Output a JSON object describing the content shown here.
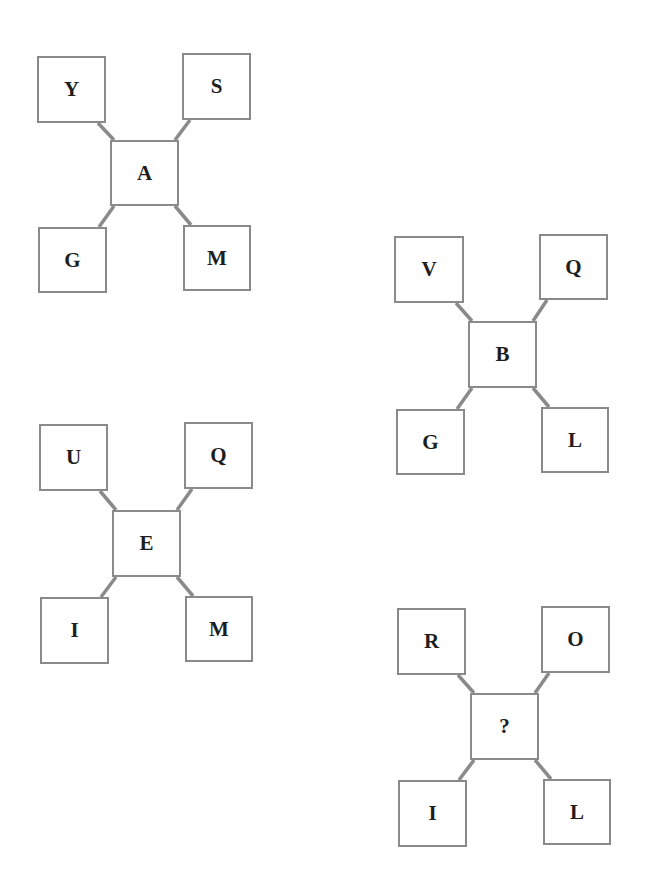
{
  "puzzle": {
    "colors": {
      "border": "#8a8a8a",
      "connector": "#8a8a8a",
      "text": "#1e1e1e",
      "background": "#ffffff"
    },
    "clusters": [
      {
        "id": "cluster-1",
        "center": {
          "label": "A",
          "x": 110,
          "y": 140,
          "w": 69,
          "h": 66
        },
        "top_left": {
          "label": "Y",
          "x": 37,
          "y": 56,
          "w": 69,
          "h": 67
        },
        "top_right": {
          "label": "S",
          "x": 182,
          "y": 53,
          "w": 69,
          "h": 67
        },
        "bottom_left": {
          "label": "G",
          "x": 38,
          "y": 227,
          "w": 69,
          "h": 66
        },
        "bottom_right": {
          "label": "M",
          "x": 183,
          "y": 225,
          "w": 68,
          "h": 66
        }
      },
      {
        "id": "cluster-2",
        "center": {
          "label": "B",
          "x": 468,
          "y": 321,
          "w": 69,
          "h": 67
        },
        "top_left": {
          "label": "V",
          "x": 394,
          "y": 236,
          "w": 70,
          "h": 67
        },
        "top_right": {
          "label": "Q",
          "x": 539,
          "y": 234,
          "w": 69,
          "h": 66
        },
        "bottom_left": {
          "label": "G",
          "x": 396,
          "y": 409,
          "w": 69,
          "h": 66
        },
        "bottom_right": {
          "label": "L",
          "x": 541,
          "y": 407,
          "w": 68,
          "h": 66
        }
      },
      {
        "id": "cluster-3",
        "center": {
          "label": "E",
          "x": 112,
          "y": 510,
          "w": 69,
          "h": 67
        },
        "top_left": {
          "label": "U",
          "x": 39,
          "y": 424,
          "w": 69,
          "h": 67
        },
        "top_right": {
          "label": "Q",
          "x": 184,
          "y": 422,
          "w": 69,
          "h": 67
        },
        "bottom_left": {
          "label": "I",
          "x": 40,
          "y": 597,
          "w": 69,
          "h": 67
        },
        "bottom_right": {
          "label": "M",
          "x": 185,
          "y": 596,
          "w": 68,
          "h": 66
        }
      },
      {
        "id": "cluster-4",
        "center": {
          "label": "?",
          "x": 470,
          "y": 693,
          "w": 69,
          "h": 67
        },
        "top_left": {
          "label": "R",
          "x": 397,
          "y": 608,
          "w": 69,
          "h": 67
        },
        "top_right": {
          "label": "O",
          "x": 541,
          "y": 606,
          "w": 69,
          "h": 67
        },
        "bottom_left": {
          "label": "I",
          "x": 398,
          "y": 780,
          "w": 69,
          "h": 67
        },
        "bottom_right": {
          "label": "L",
          "x": 543,
          "y": 779,
          "w": 68,
          "h": 66
        }
      }
    ]
  }
}
